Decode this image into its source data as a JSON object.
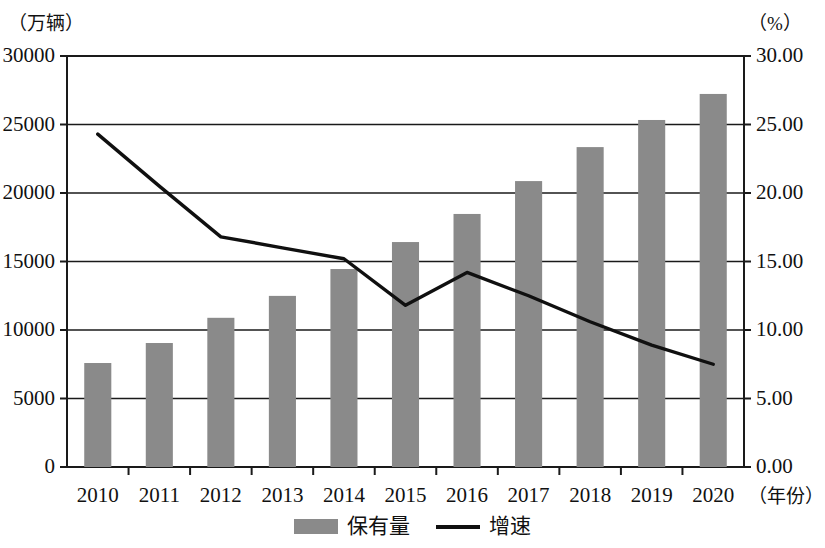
{
  "chart_data": {
    "type": "bar",
    "title": "",
    "subtitle": "",
    "categories": [
      "2010",
      "2011",
      "2012",
      "2013",
      "2014",
      "2015",
      "2016",
      "2017",
      "2018",
      "2019",
      "2020"
    ],
    "xlabel": "（年份）",
    "left_axis": {
      "label": "（万辆）",
      "ticks": [
        "0",
        "5000",
        "10000",
        "15000",
        "20000",
        "25000",
        "30000"
      ],
      "min": 0,
      "max": 30000,
      "step": 5000
    },
    "right_axis": {
      "label": "（%）",
      "ticks": [
        "0.00",
        "5.00",
        "10.00",
        "15.00",
        "20.00",
        "25.00",
        "30.00"
      ],
      "min": 0,
      "max": 30,
      "step": 5
    },
    "grid": true,
    "legend_position": "bottom",
    "series": [
      {
        "name": "保有量",
        "type": "bar",
        "axis": "left",
        "color": "#8a8a8a",
        "values": [
          7590,
          9050,
          10890,
          12490,
          14450,
          16420,
          18470,
          20870,
          23350,
          25330,
          27230
        ]
      },
      {
        "name": "增速",
        "type": "line",
        "axis": "right",
        "color": "#101010",
        "values": [
          24.3,
          20.5,
          16.8,
          16.0,
          15.2,
          11.8,
          14.2,
          12.5,
          10.6,
          8.9,
          7.5
        ]
      }
    ]
  },
  "legend": {
    "items": [
      {
        "label": "保有量",
        "marker": "bar-swatch"
      },
      {
        "label": "增速",
        "marker": "line-swatch"
      }
    ]
  }
}
